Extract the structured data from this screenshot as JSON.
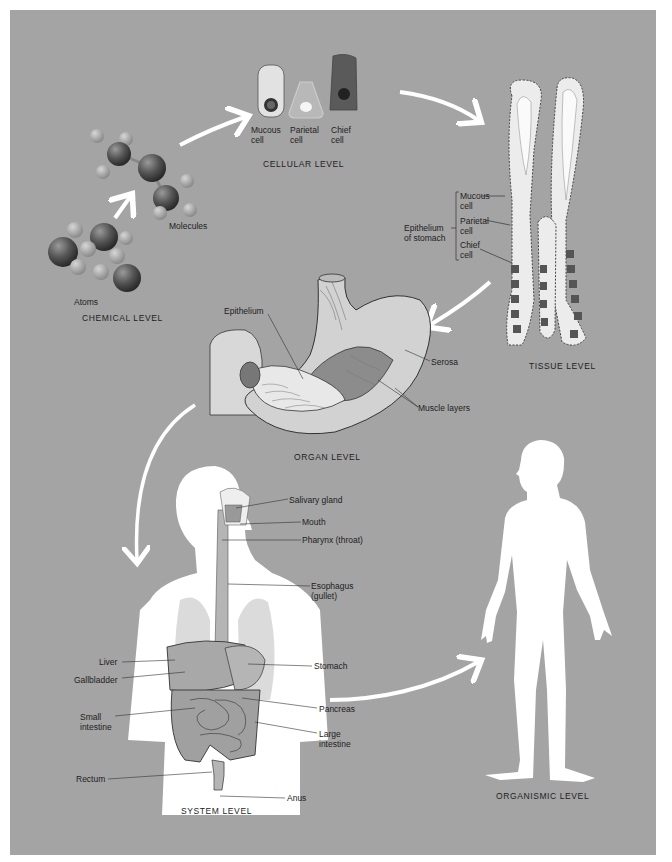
{
  "figure": {
    "background_color": "#a4a4a4",
    "arrow_color": "#ffffff",
    "levels": [
      {
        "id": "chemical",
        "label": "CHEMICAL LEVEL"
      },
      {
        "id": "cellular",
        "label": "CELLULAR LEVEL"
      },
      {
        "id": "tissue",
        "label": "TISSUE LEVEL"
      },
      {
        "id": "organ",
        "label": "ORGAN LEVEL"
      },
      {
        "id": "system",
        "label": "SYSTEM LEVEL"
      },
      {
        "id": "organismic",
        "label": "ORGANISMIC LEVEL"
      }
    ],
    "chemical": {
      "atoms_label": "Atoms",
      "molecules_label": "Molecules"
    },
    "cellular": {
      "cells": [
        {
          "line1": "Mucous",
          "line2": "cell",
          "color": "#e2e2e2"
        },
        {
          "line1": "Parietal",
          "line2": "cell",
          "color": "#bdbdbd"
        },
        {
          "line1": "Chief",
          "line2": "cell",
          "color": "#5a5a5a"
        }
      ]
    },
    "tissue": {
      "group_label_line1": "Epithelium",
      "group_label_line2": "of stomach",
      "cells": [
        {
          "line1": "Mucous",
          "line2": "cell"
        },
        {
          "line1": "Parietal",
          "line2": "cell"
        },
        {
          "line1": "Chief",
          "line2": "cell"
        }
      ]
    },
    "organ": {
      "labels": {
        "epithelium": "Epithelium",
        "serosa": "Serosa",
        "muscle_layers": "Muscle layers"
      }
    },
    "system": {
      "labels": {
        "salivary_gland": "Salivary gland",
        "mouth": "Mouth",
        "pharynx": "Pharynx (throat)",
        "esophagus_line1": "Esophagus",
        "esophagus_line2": "(gullet)",
        "liver": "Liver",
        "gallbladder": "Gallbladder",
        "stomach": "Stomach",
        "small_intestine_line1": "Small",
        "small_intestine_line2": "intestine",
        "pancreas": "Pancreas",
        "large_intestine_line1": "Large",
        "large_intestine_line2": "intestine",
        "rectum": "Rectum",
        "anus": "Anus"
      }
    }
  }
}
